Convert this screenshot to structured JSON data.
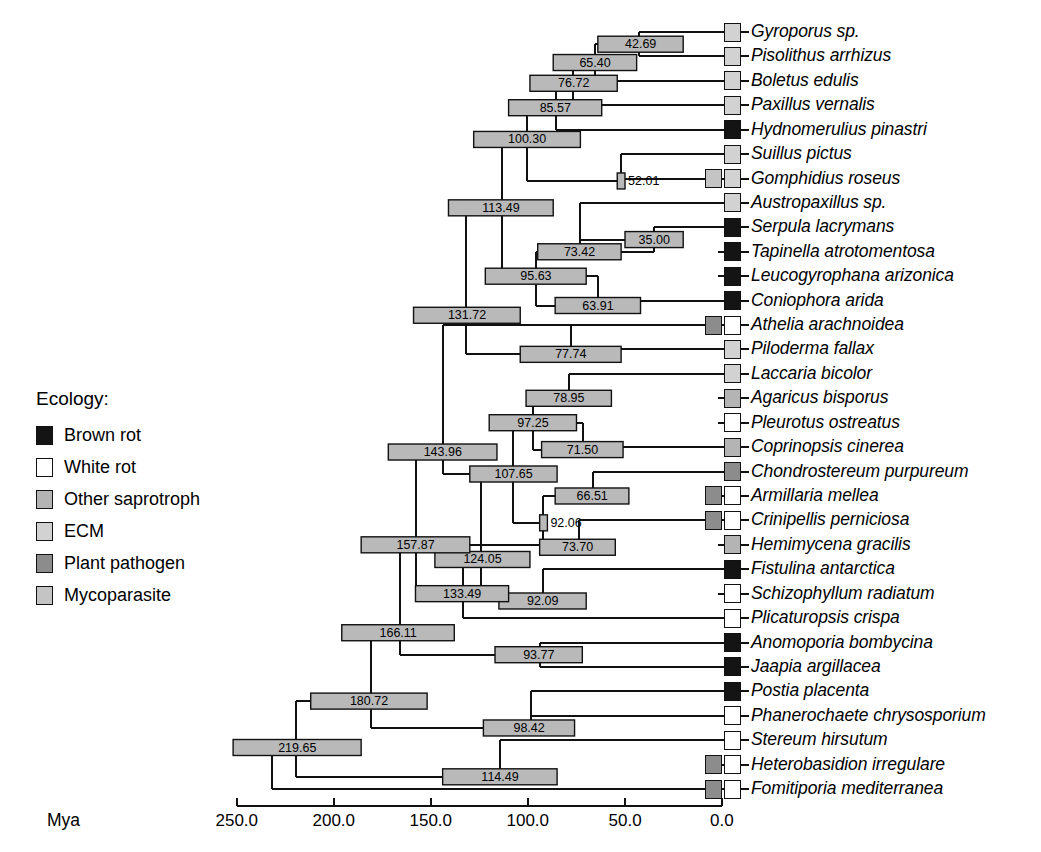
{
  "figure": {
    "axis_label": "Mya",
    "axis_ticks": [
      "250.0",
      "200.0",
      "150.0",
      "100.0",
      "50.0",
      "0.0"
    ],
    "axis_tick_values": [
      250.0,
      200.0,
      150.0,
      100.0,
      50.0,
      0.0
    ]
  },
  "legend": {
    "title": "Ecology:",
    "items": [
      {
        "label": "Brown rot",
        "color": "#141414"
      },
      {
        "label": "White rot",
        "color": "#ffffff"
      },
      {
        "label": "Other saprotroph",
        "color": "#b4b4b4"
      },
      {
        "label": "ECM",
        "color": "#d2d2d2"
      },
      {
        "label": "Plant pathogen",
        "color": "#8c8c8c"
      },
      {
        "label": "Mycoparasite",
        "color": "#c4c4c4"
      }
    ]
  },
  "chart_data": {
    "type": "tree",
    "title": "",
    "xlabel": "Mya",
    "xlim": [
      250.0,
      0.0
    ],
    "grid": false,
    "legend_position": "left-middle",
    "taxa": [
      {
        "name": "Gyroporus sp.",
        "ecology": [
          "ECM"
        ]
      },
      {
        "name": "Pisolithus arrhizus",
        "ecology": [
          "ECM"
        ]
      },
      {
        "name": "Boletus edulis",
        "ecology": [
          "ECM"
        ]
      },
      {
        "name": "Paxillus vernalis",
        "ecology": [
          "ECM"
        ]
      },
      {
        "name": "Hydnomerulius pinastri",
        "ecology": [
          "Brown rot"
        ]
      },
      {
        "name": "Suillus pictus",
        "ecology": [
          "ECM"
        ]
      },
      {
        "name": "Gomphidius roseus",
        "ecology": [
          "Mycoparasite",
          "ECM"
        ]
      },
      {
        "name": "Austropaxillus sp.",
        "ecology": [
          "ECM"
        ]
      },
      {
        "name": "Serpula lacrymans",
        "ecology": [
          "Brown rot"
        ]
      },
      {
        "name": "Tapinella atrotomentosa",
        "ecology": [
          "Brown rot"
        ]
      },
      {
        "name": "Leucogyrophana arizonica",
        "ecology": [
          "Brown rot"
        ]
      },
      {
        "name": "Coniophora arida",
        "ecology": [
          "Brown rot"
        ]
      },
      {
        "name": "Athelia arachnoidea",
        "ecology": [
          "Plant pathogen",
          "White rot"
        ]
      },
      {
        "name": "Piloderma fallax",
        "ecology": [
          "ECM"
        ]
      },
      {
        "name": "Laccaria bicolor",
        "ecology": [
          "ECM"
        ]
      },
      {
        "name": "Agaricus bisporus",
        "ecology": [
          "Other saprotroph"
        ]
      },
      {
        "name": "Pleurotus ostreatus",
        "ecology": [
          "White rot"
        ]
      },
      {
        "name": "Coprinopsis cinerea",
        "ecology": [
          "Other saprotroph"
        ]
      },
      {
        "name": "Chondrostereum purpureum",
        "ecology": [
          "Plant pathogen"
        ]
      },
      {
        "name": "Armillaria mellea",
        "ecology": [
          "Plant pathogen",
          "White rot"
        ]
      },
      {
        "name": "Crinipellis perniciosa",
        "ecology": [
          "Plant pathogen",
          "White rot"
        ]
      },
      {
        "name": "Hemimycena gracilis",
        "ecology": [
          "Other saprotroph"
        ]
      },
      {
        "name": "Fistulina antarctica",
        "ecology": [
          "Brown rot"
        ]
      },
      {
        "name": "Schizophyllum radiatum",
        "ecology": [
          "White rot"
        ]
      },
      {
        "name": "Plicaturopsis crispa",
        "ecology": [
          "White rot"
        ]
      },
      {
        "name": "Anomoporia bombycina",
        "ecology": [
          "Brown rot"
        ]
      },
      {
        "name": "Jaapia argillacea",
        "ecology": [
          "Brown rot"
        ]
      },
      {
        "name": "Postia placenta",
        "ecology": [
          "Brown rot"
        ]
      },
      {
        "name": "Phanerochaete chrysosporium",
        "ecology": [
          "White rot"
        ]
      },
      {
        "name": "Stereum hirsutum",
        "ecology": [
          "White rot"
        ]
      },
      {
        "name": "Heterobasidion irregulare",
        "ecology": [
          "Plant pathogen",
          "White rot"
        ]
      },
      {
        "name": "Fomitiporia mediterranea",
        "ecology": [
          "Plant pathogen",
          "White rot"
        ]
      }
    ],
    "nodes": [
      {
        "id": "n1",
        "age": "42.69",
        "value": 42.69,
        "ci": [
          20.0,
          64.0
        ],
        "row": 0.5,
        "children_rows": [
          0,
          1
        ]
      },
      {
        "id": "n2",
        "age": "65.40",
        "value": 65.4,
        "ci": [
          44.0,
          87.0
        ],
        "row": 1.25,
        "children_rows": [
          0.5,
          2
        ]
      },
      {
        "id": "n3",
        "age": "76.72",
        "value": 76.72,
        "ci": [
          54.0,
          99.0
        ],
        "row": 2.1,
        "children_rows": [
          1.25,
          3
        ]
      },
      {
        "id": "n4",
        "age": "85.57",
        "value": 85.57,
        "ci": [
          62.0,
          110.0
        ],
        "row": 3.1,
        "children_rows": [
          2.1,
          4
        ]
      },
      {
        "id": "n5",
        "age": "100.30",
        "value": 100.3,
        "ci": [
          73.0,
          128.0
        ],
        "row": 4.4,
        "children_rows": [
          3.1,
          6.1
        ]
      },
      {
        "id": "n6",
        "age": "52.01",
        "value": 52.01,
        "ci": [
          50.0,
          54.0
        ],
        "row": 6.1,
        "children_rows": [
          5,
          6
        ]
      },
      {
        "id": "n7",
        "age": "113.49",
        "value": 113.49,
        "ci": [
          87.0,
          141.0
        ],
        "row": 7.2,
        "children_rows": [
          4.4,
          10.0
        ]
      },
      {
        "id": "n8",
        "age": "35.00",
        "value": 35.0,
        "ci": [
          20.0,
          50.0
        ],
        "row": 8.5,
        "children_rows": [
          8,
          9
        ]
      },
      {
        "id": "n9",
        "age": "73.42",
        "value": 73.42,
        "ci": [
          52.0,
          95.0
        ],
        "row": 9.0,
        "children_rows": [
          7,
          8.5
        ]
      },
      {
        "id": "n10",
        "age": "95.63",
        "value": 95.63,
        "ci": [
          70.0,
          122.0
        ],
        "row": 10.0,
        "children_rows": [
          9.0,
          11.2
        ]
      },
      {
        "id": "n11",
        "age": "63.91",
        "value": 63.91,
        "ci": [
          42.0,
          86.0
        ],
        "row": 11.2,
        "children_rows": [
          10,
          11
        ]
      },
      {
        "id": "n12",
        "age": "131.72",
        "value": 131.72,
        "ci": [
          104.0,
          159.0
        ],
        "row": 11.6,
        "children_rows": [
          7.2,
          13.2
        ]
      },
      {
        "id": "n13",
        "age": "77.74",
        "value": 77.74,
        "ci": [
          52.0,
          104.0
        ],
        "row": 13.2,
        "children_rows": [
          12,
          13
        ]
      },
      {
        "id": "n14",
        "age": "78.95",
        "value": 78.95,
        "ci": [
          57.0,
          101.0
        ],
        "row": 15.0,
        "children_rows": [
          14,
          15
        ]
      },
      {
        "id": "n15",
        "age": "97.25",
        "value": 97.25,
        "ci": [
          75.0,
          120.0
        ],
        "row": 16.0,
        "children_rows": [
          15.0,
          17.1
        ]
      },
      {
        "id": "n16",
        "age": "71.50",
        "value": 71.5,
        "ci": [
          51.0,
          93.0
        ],
        "row": 17.1,
        "children_rows": [
          16,
          17
        ]
      },
      {
        "id": "n17",
        "age": "107.65",
        "value": 107.65,
        "ci": [
          85.0,
          130.0
        ],
        "row": 18.1,
        "children_rows": [
          16.0,
          20.1
        ]
      },
      {
        "id": "n18",
        "age": "66.51",
        "value": 66.51,
        "ci": [
          48.0,
          86.0
        ],
        "row": 19.0,
        "children_rows": [
          18,
          19
        ]
      },
      {
        "id": "n19",
        "age": "92.06",
        "value": 92.06,
        "ci": [
          90.0,
          94.0
        ],
        "row": 20.1,
        "children_rows": [
          19.0,
          21.1
        ]
      },
      {
        "id": "n20",
        "age": "73.70",
        "value": 73.7,
        "ci": [
          55.0,
          94.0
        ],
        "row": 21.1,
        "children_rows": [
          20,
          21
        ]
      },
      {
        "id": "n21",
        "age": "143.96",
        "value": 143.96,
        "ci": [
          116.0,
          172.0
        ],
        "row": 17.2,
        "children_rows": [
          18.1,
          12.0
        ]
      },
      {
        "id": "n22",
        "age": "124.05",
        "value": 124.05,
        "ci": [
          99.0,
          148.0
        ],
        "row": 21.6,
        "children_rows": [
          18.1,
          23.3
        ]
      },
      {
        "id": "n23",
        "age": "92.09",
        "value": 92.09,
        "ci": [
          70.0,
          115.0
        ],
        "row": 23.3,
        "children_rows": [
          22,
          23
        ]
      },
      {
        "id": "n24",
        "age": "133.49",
        "value": 133.49,
        "ci": [
          110.0,
          158.0
        ],
        "row": 23.0,
        "children_rows": [
          21.6,
          24.0
        ]
      },
      {
        "id": "n25",
        "age": "157.87",
        "value": 157.87,
        "ci": [
          130.0,
          186.0
        ],
        "row": 21.0,
        "children_rows": [
          17.2,
          23.0
        ]
      },
      {
        "id": "n26",
        "age": "93.77",
        "value": 93.77,
        "ci": [
          72.0,
          117.0
        ],
        "row": 25.5,
        "children_rows": [
          25,
          26
        ]
      },
      {
        "id": "n27",
        "age": "166.11",
        "value": 166.11,
        "ci": [
          138.0,
          196.0
        ],
        "row": 24.6,
        "children_rows": [
          21.0,
          25.5
        ]
      },
      {
        "id": "n28",
        "age": "98.42",
        "value": 98.42,
        "ci": [
          76.0,
          123.0
        ],
        "row": 28.5,
        "children_rows": [
          27,
          28
        ]
      },
      {
        "id": "n29",
        "age": "180.72",
        "value": 180.72,
        "ci": [
          152.0,
          212.0
        ],
        "row": 27.4,
        "children_rows": [
          24.6,
          28.5
        ]
      },
      {
        "id": "n30",
        "age": "114.49",
        "value": 114.49,
        "ci": [
          85.0,
          144.0
        ],
        "row": 30.5,
        "children_rows": [
          29,
          30.5
        ]
      },
      {
        "id": "n31",
        "age": "219.65",
        "value": 219.65,
        "ci": [
          186.0,
          252.0
        ],
        "row": 29.3,
        "children_rows": [
          27.4,
          30.5
        ]
      },
      {
        "id": "n32",
        "age": "",
        "value": 232.0,
        "ci": null,
        "row": 30.6,
        "children_rows": [
          29.3,
          31
        ]
      }
    ]
  }
}
